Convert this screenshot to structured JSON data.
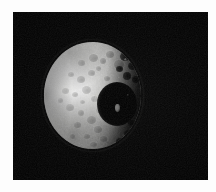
{
  "page": {
    "background_color": "#fdfdfd",
    "width": 216,
    "height": 192
  },
  "photo": {
    "frame": {
      "x": 13,
      "y": 12,
      "width": 195,
      "height": 168,
      "background_color": "#000000",
      "margin_color": "#fdfdfd"
    },
    "subject": "moon-mimas",
    "scene": "spacecraft image of an airless, heavily cratered icy moon against black space",
    "illumination": "sunlight from the left; right-hand limb in shadow (terminator)",
    "colors": {
      "space": "#000000",
      "surface_highlight": "#e9e9e7",
      "surface_midtone": "#bcbcba",
      "surface_shadow": "#3c3c3b",
      "crater_floor": "#020202",
      "central_peak": "#f2f2f0",
      "matte": "#fdfdfd"
    },
    "disc": {
      "x": 31,
      "y": 30,
      "width": 97,
      "height": 107,
      "lit_fraction_label": "gibbous"
    },
    "features": {
      "large_crater": {
        "name": "large-impact-crater",
        "x": 53,
        "y": 40,
        "width": 40,
        "height": 44,
        "has_central_peak": true
      },
      "central_peak": {
        "name": "central-peak",
        "x": 71,
        "y": 62,
        "width": 5,
        "height": 8
      }
    },
    "craters": [
      {
        "x": 34,
        "y": 18,
        "w": 7,
        "h": 6,
        "d": 0.4,
        "l": 0.3
      },
      {
        "x": 45,
        "y": 12,
        "w": 9,
        "h": 8,
        "d": 0.46,
        "l": 0.34
      },
      {
        "x": 56,
        "y": 16,
        "w": 6,
        "h": 6,
        "d": 0.5,
        "l": 0.28
      },
      {
        "x": 62,
        "y": 9,
        "w": 8,
        "h": 7,
        "d": 0.54,
        "l": 0.3
      },
      {
        "x": 70,
        "y": 18,
        "w": 10,
        "h": 9,
        "d": 0.58,
        "l": 0.36
      },
      {
        "x": 24,
        "y": 30,
        "w": 6,
        "h": 5,
        "d": 0.36,
        "l": 0.26
      },
      {
        "x": 33,
        "y": 34,
        "w": 8,
        "h": 7,
        "d": 0.42,
        "l": 0.3
      },
      {
        "x": 44,
        "y": 28,
        "w": 7,
        "h": 6,
        "d": 0.44,
        "l": 0.28
      },
      {
        "x": 52,
        "y": 24,
        "w": 5,
        "h": 5,
        "d": 0.4,
        "l": 0.24
      },
      {
        "x": 18,
        "y": 46,
        "w": 7,
        "h": 6,
        "d": 0.34,
        "l": 0.24
      },
      {
        "x": 28,
        "y": 50,
        "w": 6,
        "h": 5,
        "d": 0.38,
        "l": 0.26
      },
      {
        "x": 38,
        "y": 44,
        "w": 9,
        "h": 8,
        "d": 0.4,
        "l": 0.3
      },
      {
        "x": 47,
        "y": 54,
        "w": 7,
        "h": 6,
        "d": 0.42,
        "l": 0.26
      },
      {
        "x": 22,
        "y": 62,
        "w": 8,
        "h": 7,
        "d": 0.36,
        "l": 0.26
      },
      {
        "x": 34,
        "y": 68,
        "w": 6,
        "h": 6,
        "d": 0.4,
        "l": 0.24
      },
      {
        "x": 43,
        "y": 74,
        "w": 9,
        "h": 8,
        "d": 0.44,
        "l": 0.3
      },
      {
        "x": 30,
        "y": 80,
        "w": 7,
        "h": 6,
        "d": 0.42,
        "l": 0.26
      },
      {
        "x": 50,
        "y": 84,
        "w": 8,
        "h": 7,
        "d": 0.46,
        "l": 0.28
      },
      {
        "x": 40,
        "y": 92,
        "w": 6,
        "h": 5,
        "d": 0.4,
        "l": 0.22
      },
      {
        "x": 56,
        "y": 94,
        "w": 7,
        "h": 6,
        "d": 0.48,
        "l": 0.26
      },
      {
        "x": 26,
        "y": 92,
        "w": 5,
        "h": 5,
        "d": 0.34,
        "l": 0.2
      },
      {
        "x": 60,
        "y": 34,
        "w": 6,
        "h": 5,
        "d": 0.44,
        "l": 0.26
      },
      {
        "x": 14,
        "y": 56,
        "w": 5,
        "h": 5,
        "d": 0.3,
        "l": 0.2
      },
      {
        "x": 36,
        "y": 58,
        "w": 5,
        "h": 4,
        "d": 0.34,
        "l": 0.2
      },
      {
        "x": 52,
        "y": 66,
        "w": 5,
        "h": 5,
        "d": 0.38,
        "l": 0.22
      },
      {
        "x": 46,
        "y": 100,
        "w": 7,
        "h": 5,
        "d": 0.44,
        "l": 0.22
      }
    ],
    "terminator_craters": [
      {
        "x": 76,
        "y": 10,
        "w": 10,
        "h": 9
      },
      {
        "x": 84,
        "y": 20,
        "w": 9,
        "h": 8
      },
      {
        "x": 79,
        "y": 30,
        "w": 8,
        "h": 8
      },
      {
        "x": 88,
        "y": 34,
        "w": 7,
        "h": 7
      },
      {
        "x": 72,
        "y": 24,
        "w": 7,
        "h": 6
      },
      {
        "x": 80,
        "y": 88,
        "w": 9,
        "h": 8
      },
      {
        "x": 72,
        "y": 96,
        "w": 8,
        "h": 7
      },
      {
        "x": 64,
        "y": 104,
        "w": 9,
        "h": 8
      },
      {
        "x": 84,
        "y": 78,
        "w": 7,
        "h": 6
      }
    ],
    "terminator_sparks": [
      {
        "x": 80,
        "y": 16,
        "w": 3,
        "h": 3
      },
      {
        "x": 86,
        "y": 28,
        "w": 2,
        "h": 2
      },
      {
        "x": 74,
        "y": 34,
        "w": 2,
        "h": 3
      },
      {
        "x": 90,
        "y": 44,
        "w": 2,
        "h": 2
      },
      {
        "x": 83,
        "y": 52,
        "w": 2,
        "h": 2
      },
      {
        "x": 78,
        "y": 92,
        "w": 3,
        "h": 3
      },
      {
        "x": 70,
        "y": 100,
        "w": 2,
        "h": 2
      },
      {
        "x": 88,
        "y": 86,
        "w": 2,
        "h": 2
      },
      {
        "x": 62,
        "y": 110,
        "w": 3,
        "h": 2
      }
    ]
  }
}
